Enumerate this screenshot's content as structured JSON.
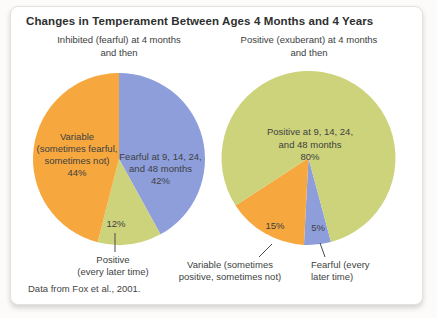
{
  "figure": {
    "title": "Changes in Temperament Between Ages 4 Months and 4 Years",
    "left_subtitle": [
      "Inhibited (fearful) at 4 months",
      "and then"
    ],
    "right_subtitle": [
      "Positive (exuberant) at 4 months",
      "and then"
    ],
    "source_note": "Data from Fox et al., 2001."
  },
  "colors": {
    "orange": "#F6A83F",
    "blue": "#8E9EDB",
    "green": "#CDD37B",
    "text": "#3d3f3f",
    "leader_line": "#4a4a4a"
  },
  "chart_data": [
    {
      "type": "pie",
      "title": "Inhibited (fearful) at 4 months and then",
      "legend_position": "inside",
      "slices": [
        {
          "key": "fearful",
          "label": "Fearful at 9, 14, 24, and 48 months",
          "value": 42,
          "color": "#8E9EDB"
        },
        {
          "key": "positive",
          "label": "Positive (every later time)",
          "value": 12,
          "color": "#CDD37B"
        },
        {
          "key": "variable",
          "label": "Variable (sometimes fearful, sometimes not)",
          "value": 44,
          "color": "#F6A83F"
        }
      ]
    },
    {
      "type": "pie",
      "title": "Positive (exuberant) at 4 months and then",
      "legend_position": "inside",
      "slices": [
        {
          "key": "fearful",
          "label": "Fearful (every later time)",
          "value": 5,
          "color": "#8E9EDB"
        },
        {
          "key": "variable",
          "label": "Variable (sometimes positive, sometimes not)",
          "value": 15,
          "color": "#F6A83F"
        },
        {
          "key": "positive",
          "label": "Positive at 9, 14, 24, and 48 months",
          "value": 80,
          "color": "#CDD37B"
        }
      ]
    }
  ],
  "labels": {
    "left_variable": [
      "Variable",
      "(sometimes fearful,",
      "sometimes not)",
      "44%"
    ],
    "left_fearful": [
      "Fearful at 9, 14, 24,",
      "and 48 months",
      "42%"
    ],
    "left_positive_pct": "12%",
    "left_positive": [
      "Positive",
      "(every later time)"
    ],
    "right_positive": [
      "Positive at 9, 14, 24,",
      "and 48 months",
      "80%"
    ],
    "right_variable_pct": "15%",
    "right_fearful_pct": "5%",
    "right_variable": [
      "Variable (sometimes",
      "positive, sometimes not)"
    ],
    "right_fearful": [
      "Fearful (every",
      "later time)"
    ]
  }
}
